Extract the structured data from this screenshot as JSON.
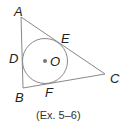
{
  "diagram": {
    "vertices": {
      "A": "A",
      "B": "B",
      "C": "C"
    },
    "tangent_points": {
      "D": "D",
      "E": "E",
      "F": "F"
    },
    "center": "O",
    "caption": "(Ex. 5–6)",
    "colors": {
      "lines": "#888888",
      "text": "#222222",
      "center_dot": "#777777"
    }
  }
}
